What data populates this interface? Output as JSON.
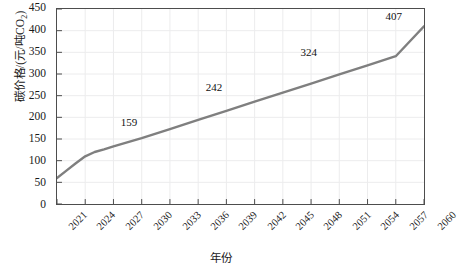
{
  "chart_data": {
    "type": "line",
    "title": "",
    "xlabel": "年份",
    "ylabel": "碳价格/(元/吨CO2)",
    "ylabel_main": "碳价格/(元/吨CO",
    "ylabel_sub": "2",
    "ylabel_tail": ")",
    "xlim": [
      2021,
      2060
    ],
    "ylim": [
      0,
      450
    ],
    "yticks": [
      0,
      50,
      100,
      150,
      200,
      250,
      300,
      350,
      400,
      450
    ],
    "xticks": [
      2021,
      2024,
      2027,
      2030,
      2033,
      2036,
      2039,
      2042,
      2045,
      2048,
      2051,
      2054,
      2057,
      2060
    ],
    "grid": true,
    "legend": "none",
    "line_color": "#7f7f7f",
    "line_width": 2.4,
    "series": [
      {
        "name": "碳价格",
        "x": [
          2021,
          2022,
          2023,
          2024,
          2025,
          2026,
          2027,
          2030,
          2033,
          2036,
          2039,
          2042,
          2045,
          2048,
          2051,
          2054,
          2057,
          2060
        ],
        "values": [
          60,
          77,
          94,
          110,
          120,
          126,
          133,
          152,
          173,
          194,
          215,
          236,
          257,
          278,
          299,
          320,
          341,
          410
        ]
      }
    ],
    "annotations": [
      {
        "label": "159",
        "x": 2029,
        "y": 188
      },
      {
        "label": "242",
        "x": 2038,
        "y": 268
      },
      {
        "label": "324",
        "x": 2048,
        "y": 348
      },
      {
        "label": "407",
        "x": 2057,
        "y": 430
      }
    ]
  }
}
